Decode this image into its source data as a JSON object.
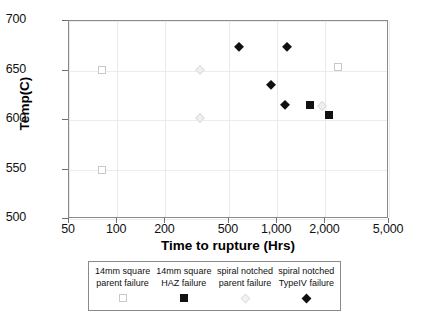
{
  "chart_data": {
    "type": "scatter",
    "title": "",
    "xlabel": "Time to rupture (Hrs)",
    "ylabel": "Temp(C)",
    "xscale": "log",
    "xlim": [
      50,
      5000
    ],
    "ylim": [
      500,
      700
    ],
    "xticks": [
      "50",
      "100",
      "200",
      "500",
      "1,000",
      "2,000",
      "5,000"
    ],
    "xtick_values": [
      50,
      100,
      200,
      500,
      1000,
      2000,
      5000
    ],
    "yticks": [
      "500",
      "550",
      "600",
      "650",
      "700"
    ],
    "ytick_values": [
      500,
      550,
      600,
      650,
      700
    ],
    "grid": true,
    "legend_position": "below",
    "series": [
      {
        "name": "14mm square parent failure",
        "marker": "open-square",
        "points": [
          {
            "x": 80,
            "y": 651
          },
          {
            "x": 80,
            "y": 550
          },
          {
            "x": 2400,
            "y": 654
          }
        ]
      },
      {
        "name": "14mm square HAZ failure",
        "marker": "filled-square",
        "points": [
          {
            "x": 1600,
            "y": 615
          },
          {
            "x": 2100,
            "y": 605
          }
        ]
      },
      {
        "name": "spiral notched parent failure",
        "marker": "faint-diamond",
        "points": [
          {
            "x": 330,
            "y": 651
          },
          {
            "x": 330,
            "y": 602
          },
          {
            "x": 1900,
            "y": 614
          }
        ]
      },
      {
        "name": "spiral notched TypeIV failure",
        "marker": "filled-diamond",
        "points": [
          {
            "x": 580,
            "y": 674
          },
          {
            "x": 1150,
            "y": 674
          },
          {
            "x": 920,
            "y": 635
          },
          {
            "x": 1120,
            "y": 615
          }
        ]
      }
    ]
  },
  "legend": {
    "entries": [
      {
        "line1": "14mm square",
        "line2": "parent failure",
        "marker": "open-square"
      },
      {
        "line1": "14mm square",
        "line2": "HAZ failure",
        "marker": "filled-square"
      },
      {
        "line1": "spiral notched",
        "line2": "parent failure",
        "marker": "faint-diamond"
      },
      {
        "line1": "spiral notched",
        "line2": "TypeIV failure",
        "marker": "filled-diamond"
      }
    ]
  },
  "colors": {
    "axis": "#8a8a8a",
    "grid": "#ececec",
    "marker_dark": "#101010",
    "marker_light": "#c9c9c9",
    "background": "#ffffff"
  }
}
